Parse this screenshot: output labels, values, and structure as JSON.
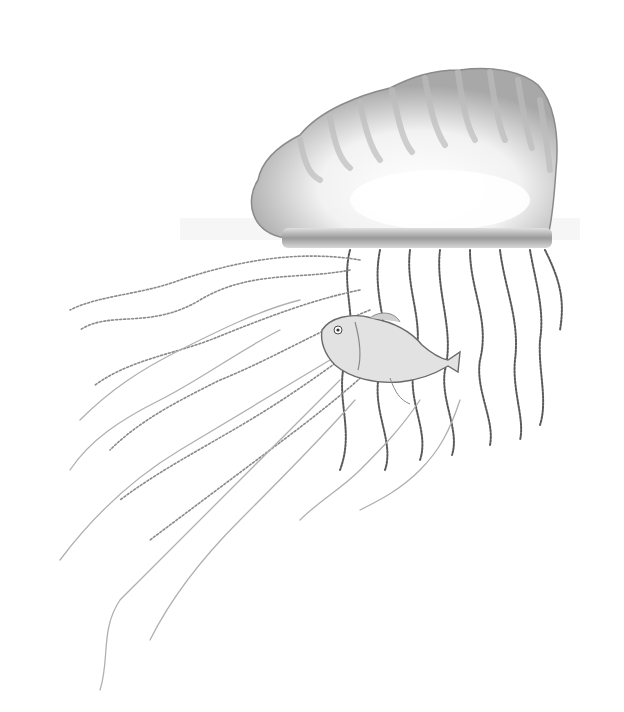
{
  "image": {
    "subject": "Portuguese man o' war with fish among tentacles",
    "style": "pencil illustration",
    "background": "#ffffff",
    "colors": {
      "float_fill": "#f6f6f6",
      "float_shade": "#b8b8b8",
      "float_outline": "#8a8a8a",
      "water_band": "#9a9a9a",
      "tentacle_dark": "#5a5a5a",
      "tentacle_light": "#b0b0b0",
      "fish_fill": "#e2e2e2",
      "fish_outline": "#6a6a6a"
    }
  }
}
